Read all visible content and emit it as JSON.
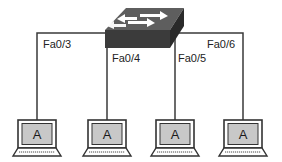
{
  "diagram": {
    "type": "network-topology",
    "switch": {
      "name": "switch",
      "icon": "switch-icon"
    },
    "links": [
      {
        "port": "Fa0/3",
        "host": "A"
      },
      {
        "port": "Fa0/4",
        "host": "A"
      },
      {
        "port": "Fa0/5",
        "host": "A"
      },
      {
        "port": "Fa0/6",
        "host": "A"
      }
    ],
    "colors": {
      "line": "#3a3a3a",
      "switch_top": "#5a5a5a",
      "switch_front": "#3a3a3a",
      "switch_side": "#2a2a2a",
      "arrow": "#ffffff",
      "laptop_frame": "#333333",
      "laptop_screen": "#c8c8c8"
    }
  }
}
